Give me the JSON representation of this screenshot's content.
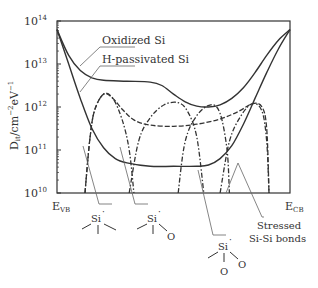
{
  "chart_data": {
    "type": "line",
    "title": "",
    "ylabel": "D_it/cm^-2eV^-1",
    "ylabel_parts": {
      "base": "D",
      "sub": "it",
      "unit": "/cm",
      "exp1": "−2",
      "mid": "eV",
      "exp2": "−1"
    },
    "xlabel_left": {
      "base": "E",
      "sub": "VB"
    },
    "xlabel_right": {
      "base": "E",
      "sub": "CB"
    },
    "yscale": "log",
    "ylim_exponents": [
      10,
      14
    ],
    "yticks": [
      {
        "base": "10",
        "exp": "14"
      },
      {
        "base": "10",
        "exp": "13"
      },
      {
        "base": "10",
        "exp": "12"
      },
      {
        "base": "10",
        "exp": "11"
      },
      {
        "base": "10",
        "exp": "10"
      }
    ],
    "xlim": [
      0,
      1
    ],
    "series": [
      {
        "name": "Oxidized Si",
        "style": "solid",
        "points": [
          [
            0,
            13.8
          ],
          [
            0.05,
            13.2
          ],
          [
            0.1,
            12.85
          ],
          [
            0.15,
            12.68
          ],
          [
            0.2,
            12.62
          ],
          [
            0.3,
            12.6
          ],
          [
            0.4,
            12.58
          ],
          [
            0.45,
            12.5
          ],
          [
            0.5,
            12.3
          ],
          [
            0.55,
            12.12
          ],
          [
            0.6,
            12.02
          ],
          [
            0.65,
            12.0
          ],
          [
            0.7,
            12.05
          ],
          [
            0.75,
            12.2
          ],
          [
            0.8,
            12.45
          ],
          [
            0.85,
            12.8
          ],
          [
            0.9,
            13.2
          ],
          [
            0.95,
            13.55
          ],
          [
            1.0,
            13.8
          ]
        ]
      },
      {
        "name": "H-passivated Si",
        "style": "solid",
        "points": [
          [
            0,
            13.8
          ],
          [
            0.05,
            13.0
          ],
          [
            0.1,
            12.2
          ],
          [
            0.15,
            11.5
          ],
          [
            0.2,
            11.05
          ],
          [
            0.25,
            10.8
          ],
          [
            0.3,
            10.7
          ],
          [
            0.4,
            10.62
          ],
          [
            0.5,
            10.62
          ],
          [
            0.6,
            10.62
          ],
          [
            0.65,
            10.65
          ],
          [
            0.7,
            10.8
          ],
          [
            0.75,
            11.1
          ],
          [
            0.8,
            11.6
          ],
          [
            0.85,
            12.2
          ],
          [
            0.9,
            12.8
          ],
          [
            0.95,
            13.35
          ],
          [
            1.0,
            13.8
          ]
        ]
      },
      {
        "name": "Sum (dashed envelope)",
        "style": "dashed",
        "points": [
          [
            0.12,
            10.0
          ],
          [
            0.14,
            11.2
          ],
          [
            0.16,
            11.9
          ],
          [
            0.2,
            12.3
          ],
          [
            0.24,
            12.2
          ],
          [
            0.28,
            11.95
          ],
          [
            0.33,
            11.7
          ],
          [
            0.4,
            11.58
          ],
          [
            0.5,
            11.55
          ],
          [
            0.6,
            11.6
          ],
          [
            0.7,
            11.72
          ],
          [
            0.78,
            11.9
          ],
          [
            0.84,
            12.08
          ],
          [
            0.88,
            12.0
          ],
          [
            0.9,
            11.5
          ],
          [
            0.91,
            10.0
          ]
        ]
      },
      {
        "name": "Si dangling bond (Si3)",
        "style": "dashdot",
        "points": [
          [
            0.12,
            10.0
          ],
          [
            0.14,
            11.2
          ],
          [
            0.16,
            11.9
          ],
          [
            0.2,
            12.3
          ],
          [
            0.24,
            12.2
          ],
          [
            0.28,
            11.7
          ],
          [
            0.31,
            11.0
          ],
          [
            0.33,
            10.0
          ]
        ]
      },
      {
        "name": "Si dangling bond (Si2O)",
        "style": "dashdot",
        "points": [
          [
            0.31,
            10.0
          ],
          [
            0.35,
            11.2
          ],
          [
            0.4,
            11.75
          ],
          [
            0.46,
            12.05
          ],
          [
            0.52,
            12.1
          ],
          [
            0.56,
            11.9
          ],
          [
            0.6,
            11.3
          ],
          [
            0.63,
            10.0
          ]
        ]
      },
      {
        "name": "Si dangling bond (SiO2)",
        "style": "dashdot",
        "points": [
          [
            0.52,
            10.0
          ],
          [
            0.55,
            11.2
          ],
          [
            0.6,
            11.8
          ],
          [
            0.66,
            12.05
          ],
          [
            0.7,
            11.85
          ],
          [
            0.73,
            11.0
          ],
          [
            0.74,
            10.0
          ]
        ]
      },
      {
        "name": "Stressed Si-Si bonds",
        "style": "dashdot",
        "points": [
          [
            0.7,
            10.0
          ],
          [
            0.74,
            11.2
          ],
          [
            0.79,
            11.8
          ],
          [
            0.84,
            12.08
          ],
          [
            0.88,
            11.9
          ],
          [
            0.9,
            11.2
          ],
          [
            0.91,
            10.0
          ]
        ]
      }
    ],
    "annotations": [
      "Oxidized Si",
      "H-passivated Si",
      "Stressed Si-Si bonds"
    ],
    "legend": "none",
    "grid": false
  },
  "labels": {
    "oxidized": "Oxidized Si",
    "hpass": "H-passivated Si",
    "stressed_line1": "Stressed",
    "stressed_line2": "Si-Si bonds",
    "si": "Si",
    "dot": "·",
    "o": "O"
  },
  "defects": [
    {
      "name": "Si-three-Si-backbonds",
      "oxygens": 0
    },
    {
      "name": "Si-two-Si-one-O",
      "oxygens": 1
    },
    {
      "name": "Si-one-Si-two-O",
      "oxygens": 2
    }
  ]
}
